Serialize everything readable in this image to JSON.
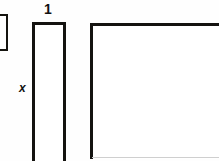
{
  "figure": {
    "kind": "geometry-diagram",
    "background_color": "#fefefe",
    "stroke_color": "#141310",
    "fill_color": "#ffffff",
    "labels": {
      "width_label": "1",
      "height_label": "x"
    },
    "shapes": [
      {
        "name": "partial-rectangle-left",
        "description": "rectangle outline clipped by the left edge of the image",
        "clipped_sides": [
          "left"
        ]
      },
      {
        "name": "narrow-tall-rectangle",
        "description": "tall thin rectangle labeled width 1 and height x",
        "clipped_sides": [
          "bottom"
        ],
        "width_label": "1",
        "height_label": "x"
      },
      {
        "name": "large-rectangle",
        "description": "large square-like rectangle clipped at the right and bottom edges",
        "clipped_sides": [
          "right",
          "bottom"
        ]
      }
    ]
  }
}
